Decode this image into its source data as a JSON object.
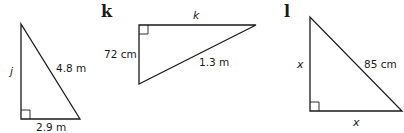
{
  "figures": [
    {
      "id": "j",
      "question_label": "",
      "vertical_side": "j",
      "horizontal_side": "2.9 m",
      "hypotenuse": "4.8 m"
    },
    {
      "id": "k",
      "question_label": "k",
      "vertical_side": "72 cm",
      "horizontal_side": "k",
      "hypotenuse": "1.3 m"
    },
    {
      "id": "l",
      "question_label": "l",
      "vertical_side": "x",
      "horizontal_side": "x",
      "hypotenuse": "85 cm"
    }
  ]
}
